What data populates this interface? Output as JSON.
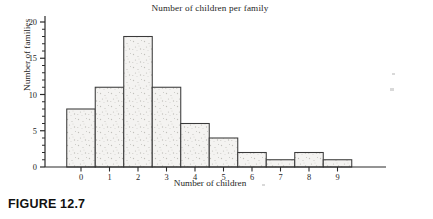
{
  "figure": {
    "caption": "FIGURE 12.7"
  },
  "chart_data": {
    "type": "bar",
    "title": "Number of children per family",
    "xlabel": "Number of children",
    "ylabel": "Number of families",
    "categories": [
      "0",
      "1",
      "2",
      "3",
      "4",
      "5",
      "6",
      "7",
      "8",
      "9"
    ],
    "values": [
      8,
      11,
      18,
      11,
      6,
      4,
      2,
      1,
      2,
      1
    ],
    "xtick_labels": [
      "0",
      "1",
      "2",
      "3",
      "4",
      "5",
      "6",
      "7",
      "8",
      "9"
    ],
    "ytick_labels": [
      "0",
      "5",
      "10",
      "15",
      "20"
    ],
    "ytick_values": [
      0,
      5,
      10,
      15,
      20
    ],
    "yminor_step": 1,
    "xlim": [
      -0.5,
      9.5
    ],
    "ylim": [
      0,
      21
    ],
    "grid": false,
    "legend": null,
    "bar_style": "outlined-histogram",
    "colors": {
      "axis": "#2b2b2b",
      "bar_outline": "#3a3a3a",
      "bar_fill": "#f4f3f1",
      "text": "#262626"
    }
  }
}
